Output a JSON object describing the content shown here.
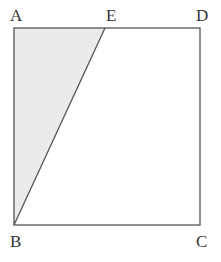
{
  "diagram": {
    "type": "geometry",
    "colors": {
      "shade_fill": "#ebebeb",
      "stroke": "#555555",
      "label": "#333333"
    },
    "points": {
      "A": {
        "label": "A",
        "x": 14,
        "y": 28
      },
      "E": {
        "label": "E",
        "x": 105,
        "y": 28
      },
      "D": {
        "label": "D",
        "x": 200,
        "y": 28
      },
      "B": {
        "label": "B",
        "x": 14,
        "y": 225
      },
      "C": {
        "label": "C",
        "x": 200,
        "y": 225
      }
    },
    "segments": [
      "AD",
      "DC",
      "CB",
      "BA",
      "BE"
    ],
    "shaded_region": [
      "A",
      "E",
      "B"
    ]
  }
}
